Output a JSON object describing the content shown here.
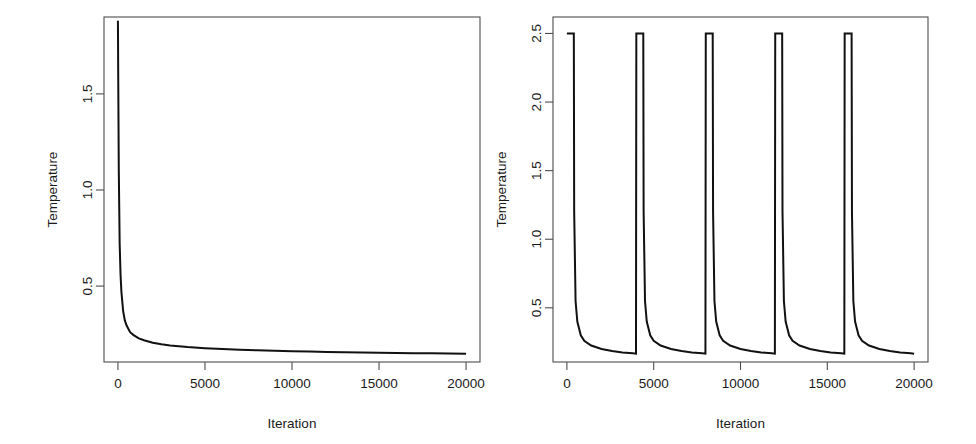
{
  "figure": {
    "background": "#ffffff",
    "line_color": "#111111",
    "axis_color": "#4d4d4d",
    "panels": [
      "left",
      "right"
    ]
  },
  "chart_data": [
    {
      "type": "line",
      "panel": "left",
      "title": "",
      "xlabel": "Iteration",
      "ylabel": "Temperature",
      "xlim": [
        -800,
        20800
      ],
      "ylim": [
        0.105,
        1.9
      ],
      "xticks": [
        0,
        5000,
        10000,
        15000,
        20000
      ],
      "xticklabels": [
        "0",
        "5000",
        "10000",
        "15000",
        "20000"
      ],
      "yticks": [
        0.5,
        1.0,
        1.5
      ],
      "yticklabels": [
        "0.5",
        "1.0",
        "1.5"
      ],
      "grid": false,
      "legend": false,
      "description": "Monotone logarithmic cooling schedule: temperature starts near 1.88 and decays sharply, asymptoting to about 0.13 by iteration 20000.",
      "series": [
        {
          "name": "Temperature",
          "x": [
            0,
            20,
            50,
            100,
            150,
            200,
            300,
            400,
            500,
            700,
            900,
            1200,
            1500,
            2000,
            2500,
            3000,
            4000,
            5000,
            6000,
            7000,
            8000,
            9000,
            10000,
            11000,
            12000,
            13000,
            14000,
            15000,
            16000,
            17000,
            18000,
            19000,
            20000
          ],
          "y": [
            1.88,
            1.55,
            1.1,
            0.72,
            0.56,
            0.47,
            0.37,
            0.32,
            0.295,
            0.26,
            0.245,
            0.228,
            0.218,
            0.205,
            0.197,
            0.191,
            0.183,
            0.177,
            0.173,
            0.169,
            0.166,
            0.163,
            0.161,
            0.159,
            0.157,
            0.156,
            0.154,
            0.153,
            0.152,
            0.151,
            0.15,
            0.149,
            0.148
          ]
        }
      ]
    },
    {
      "type": "line",
      "panel": "right",
      "title": "",
      "xlabel": "Iteration",
      "ylabel": "Temperature",
      "xlim": [
        -800,
        20800
      ],
      "ylim": [
        0.105,
        2.62
      ],
      "xticks": [
        0,
        5000,
        10000,
        15000,
        20000
      ],
      "xticklabels": [
        "0",
        "5000",
        "10000",
        "15000",
        "20000"
      ],
      "yticks": [
        0.5,
        1.0,
        1.5,
        2.0,
        2.5
      ],
      "yticklabels": [
        "0.5",
        "1.0",
        "1.5",
        "2.0",
        "2.5"
      ],
      "grid": false,
      "legend": false,
      "reheat_period": 4000,
      "reheat_peak": 2.5,
      "n_cycles": 5,
      "description": "Sawtooth reheating schedule: temperature is reset to 2.5 every 4000 iterations, then decays rapidly to about 0.15 before the next reheat.",
      "series": [
        {
          "name": "Temperature",
          "x": [
            0,
            400,
            420,
            500,
            600,
            800,
            1000,
            1400,
            2000,
            2600,
            3200,
            3800,
            3980,
            4000,
            4400,
            4420,
            4500,
            4600,
            4800,
            5000,
            5400,
            6000,
            6600,
            7200,
            7800,
            7980,
            8000,
            8400,
            8420,
            8500,
            8600,
            8800,
            9000,
            9400,
            10000,
            10600,
            11200,
            11800,
            11980,
            12000,
            12400,
            12420,
            12500,
            12600,
            12800,
            13000,
            13400,
            14000,
            14600,
            15200,
            15800,
            15980,
            16000,
            16400,
            16420,
            16500,
            16600,
            16800,
            17000,
            17400,
            18000,
            18600,
            19200,
            19800,
            20000
          ],
          "y": [
            2.5,
            2.5,
            1.2,
            0.55,
            0.4,
            0.3,
            0.26,
            0.225,
            0.2,
            0.185,
            0.175,
            0.168,
            0.166,
            2.5,
            2.5,
            1.2,
            0.55,
            0.4,
            0.3,
            0.26,
            0.225,
            0.2,
            0.185,
            0.175,
            0.168,
            0.166,
            2.5,
            2.5,
            1.2,
            0.55,
            0.4,
            0.3,
            0.26,
            0.225,
            0.2,
            0.185,
            0.175,
            0.168,
            0.166,
            2.5,
            2.5,
            1.2,
            0.55,
            0.4,
            0.3,
            0.26,
            0.225,
            0.2,
            0.185,
            0.175,
            0.168,
            0.166,
            2.5,
            2.5,
            1.2,
            0.55,
            0.4,
            0.3,
            0.26,
            0.225,
            0.2,
            0.185,
            0.175,
            0.168,
            0.166
          ]
        }
      ]
    }
  ]
}
